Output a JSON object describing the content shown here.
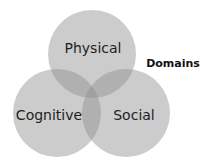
{
  "diagram": {
    "type": "venn",
    "title": "Domains",
    "sets": [
      {
        "id": "physical",
        "label": "Physical",
        "cx": 92,
        "cy": 54,
        "r": 44
      },
      {
        "id": "cognitive",
        "label": "Cognitive",
        "cx": 57,
        "cy": 113,
        "r": 44
      },
      {
        "id": "social",
        "label": "Social",
        "cx": 126,
        "cy": 113,
        "r": 44
      }
    ],
    "colors": {
      "circle_fill": "#8f8f8f",
      "background": "#ffffff",
      "text": "#1e1e1e"
    }
  }
}
